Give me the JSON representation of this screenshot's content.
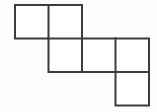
{
  "figure": {
    "shape_name": "hexomino",
    "square_count": 6,
    "row_count": 3,
    "column_count": 4,
    "background_color": "#fdfdfd",
    "line_color": "#3c3c3c",
    "fill_color": "#ffffff",
    "line_width": 2,
    "cell_size": 33.5,
    "origin": {
      "x": 15,
      "y": 5
    },
    "occupied_cells": [
      {
        "row": 0,
        "col": 0,
        "label": "square-r0c0"
      },
      {
        "row": 0,
        "col": 1,
        "label": "square-r0c1"
      },
      {
        "row": 1,
        "col": 1,
        "label": "square-r1c1"
      },
      {
        "row": 1,
        "col": 2,
        "label": "square-r1c2"
      },
      {
        "row": 1,
        "col": 3,
        "label": "square-r1c3"
      },
      {
        "row": 2,
        "col": 3,
        "label": "square-r2c3"
      }
    ],
    "grid_x": [
      15,
      48.5,
      82,
      115.5,
      149
    ],
    "grid_y": [
      5,
      38.5,
      72,
      105.5
    ],
    "squares": [
      {
        "name": "square-r0c0",
        "x": 15,
        "y": 5,
        "w": 33.5,
        "h": 33.5
      },
      {
        "name": "square-r0c1",
        "x": 48.5,
        "y": 5,
        "w": 33.5,
        "h": 33.5
      },
      {
        "name": "square-r1c1",
        "x": 48.5,
        "y": 38.5,
        "w": 33.5,
        "h": 33.5
      },
      {
        "name": "square-r1c2",
        "x": 82,
        "y": 38.5,
        "w": 33.5,
        "h": 33.5
      },
      {
        "name": "square-r1c3",
        "x": 115.5,
        "y": 38.5,
        "w": 33.5,
        "h": 33.5
      },
      {
        "name": "square-r2c3",
        "x": 115.5,
        "y": 72,
        "w": 33.5,
        "h": 33.5
      }
    ],
    "outline_path": "M 15 5 L 82 5 L 82 38.5 L 149 38.5 L 149 105.5 L 115.5 105.5 L 115.5 72 L 48.5 72 L 48.5 38.5 L 15 38.5 Z",
    "interior_segments": [
      {
        "name": "interior-vertical-col1-row0",
        "x1": 48.5,
        "y1": 5,
        "x2": 48.5,
        "y2": 38.5
      },
      {
        "name": "interior-horizontal-row1-col1",
        "x1": 48.5,
        "y1": 38.5,
        "x2": 82,
        "y2": 38.5
      },
      {
        "name": "interior-vertical-col2-row1",
        "x1": 82,
        "y1": 38.5,
        "x2": 82,
        "y2": 72
      },
      {
        "name": "interior-vertical-col3-row1",
        "x1": 115.5,
        "y1": 38.5,
        "x2": 115.5,
        "y2": 72
      },
      {
        "name": "interior-horizontal-row2-col3",
        "x1": 115.5,
        "y1": 72,
        "x2": 149,
        "y2": 72
      }
    ]
  }
}
